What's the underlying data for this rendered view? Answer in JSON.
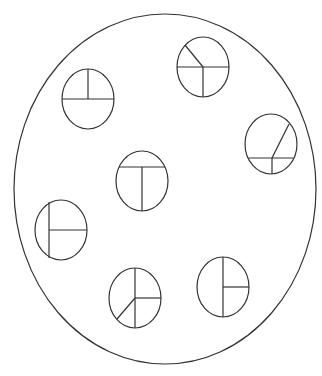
{
  "canvas": {
    "width": 322,
    "height": 376,
    "background": "#ffffff",
    "stroke_color": "#333333"
  },
  "outer_circle": {
    "cx": 165,
    "cy": 189,
    "rx": 151,
    "ry": 175
  },
  "small_circles": [
    {
      "id": "top-left",
      "cx": 88,
      "cy": 99,
      "rx": 26,
      "ry": 30,
      "lines": [
        {
          "x1": 62,
          "y1": 99,
          "x2": 114,
          "y2": 99
        },
        {
          "x1": 88,
          "y1": 69,
          "x2": 88,
          "y2": 99
        }
      ]
    },
    {
      "id": "top-right",
      "cx": 203,
      "cy": 67,
      "rx": 26,
      "ry": 30,
      "lines": [
        {
          "x1": 177,
          "y1": 67,
          "x2": 229,
          "y2": 67
        },
        {
          "x1": 203,
          "y1": 67,
          "x2": 203,
          "y2": 97
        },
        {
          "x1": 203,
          "y1": 67,
          "x2": 185,
          "y2": 45
        }
      ]
    },
    {
      "id": "right",
      "cx": 271,
      "cy": 144,
      "rx": 26,
      "ry": 30,
      "lines": [
        {
          "x1": 249,
          "y1": 158,
          "x2": 293,
          "y2": 158
        },
        {
          "x1": 272,
          "y1": 158,
          "x2": 272,
          "y2": 174
        },
        {
          "x1": 272,
          "y1": 158,
          "x2": 289,
          "y2": 124
        }
      ]
    },
    {
      "id": "center",
      "cx": 142,
      "cy": 181,
      "rx": 26,
      "ry": 30,
      "lines": [
        {
          "x1": 119,
          "y1": 167,
          "x2": 165,
          "y2": 167
        },
        {
          "x1": 142,
          "y1": 167,
          "x2": 142,
          "y2": 211
        }
      ]
    },
    {
      "id": "left",
      "cx": 61,
      "cy": 230,
      "rx": 26,
      "ry": 30,
      "lines": [
        {
          "x1": 49,
          "y1": 202,
          "x2": 49,
          "y2": 258
        },
        {
          "x1": 49,
          "y1": 230,
          "x2": 87,
          "y2": 230
        }
      ]
    },
    {
      "id": "bottom-left",
      "cx": 135,
      "cy": 298,
      "rx": 26,
      "ry": 30,
      "lines": [
        {
          "x1": 135,
          "y1": 268,
          "x2": 135,
          "y2": 328
        },
        {
          "x1": 135,
          "y1": 298,
          "x2": 161,
          "y2": 298
        },
        {
          "x1": 135,
          "y1": 298,
          "x2": 117,
          "y2": 319
        }
      ]
    },
    {
      "id": "bottom-right",
      "cx": 223,
      "cy": 287,
      "rx": 26,
      "ry": 30,
      "lines": [
        {
          "x1": 223,
          "y1": 257,
          "x2": 223,
          "y2": 317
        },
        {
          "x1": 223,
          "y1": 287,
          "x2": 249,
          "y2": 287
        }
      ]
    }
  ]
}
